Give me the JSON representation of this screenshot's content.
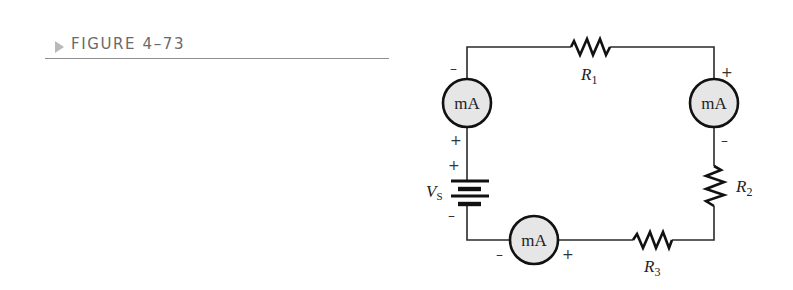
{
  "figure": {
    "caption": "FIGURE 4–73",
    "accent_color": "#b9b9b9",
    "rule_color": "#8f8f8f"
  },
  "circuit": {
    "source": {
      "label": "V",
      "subscript": "S",
      "positive_sign": "+",
      "negative_sign": "–"
    },
    "resistors": [
      {
        "id": "R1",
        "label": "R",
        "subscript": "1"
      },
      {
        "id": "R2",
        "label": "R",
        "subscript": "2"
      },
      {
        "id": "R3",
        "label": "R",
        "subscript": "3"
      }
    ],
    "ammeters": [
      {
        "id": "left",
        "label": "mA",
        "top_sign": "–",
        "bottom_sign": "+"
      },
      {
        "id": "right",
        "label": "mA",
        "top_sign": "+",
        "bottom_sign": "–"
      },
      {
        "id": "bottom",
        "label": "mA",
        "left_sign": "–",
        "right_sign": "+"
      }
    ],
    "meter_fill": "#e6e6e6"
  }
}
